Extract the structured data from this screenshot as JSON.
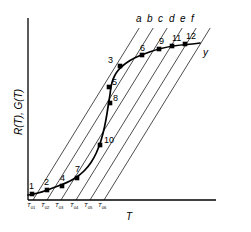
{
  "chart_data": {
    "type": "line",
    "title": "",
    "xlabel": "T",
    "ylabel": "R(T), G(T)",
    "grid": false,
    "legend": "none",
    "axis": {
      "x_origin_px": 28,
      "x_end_px": 216,
      "y_top_px": 18,
      "y_bottom_px": 200
    },
    "xtick_labels": [
      "T01",
      "T02",
      "T03",
      "T04",
      "T05",
      "T06"
    ],
    "xtick_bases": [
      "T",
      "T",
      "T",
      "T",
      "T",
      "T"
    ],
    "xtick_subs": [
      "01",
      "02",
      "03",
      "04",
      "05",
      "06"
    ],
    "xtick_px": [
      33,
      47,
      61,
      76,
      90,
      104
    ],
    "loadline_labels": [
      "a",
      "b",
      "c",
      "d",
      "e",
      "f"
    ],
    "loadline_label_px": [
      136,
      147,
      158,
      169,
      180,
      191
    ],
    "loadline_slope": -1.62,
    "loadlines": [
      {
        "name": "a",
        "x_bottom": 33,
        "x_top": 145
      },
      {
        "name": "b",
        "x_bottom": 47,
        "x_top": 159
      },
      {
        "name": "c",
        "x_bottom": 61,
        "x_top": 173
      },
      {
        "name": "d",
        "x_bottom": 76,
        "x_top": 188
      },
      {
        "name": "e",
        "x_bottom": 90,
        "x_top": 202
      },
      {
        "name": "f",
        "x_bottom": 104,
        "x_top": 216
      }
    ],
    "curve_name": "y",
    "curve_label_px": {
      "x": 203,
      "y": 48
    },
    "curve_points_px": [
      [
        28,
        195
      ],
      [
        34,
        194
      ],
      [
        42,
        192
      ],
      [
        50,
        189
      ],
      [
        58,
        186
      ],
      [
        66,
        183
      ],
      [
        74,
        179
      ],
      [
        81,
        174
      ],
      [
        88,
        167
      ],
      [
        94,
        158
      ],
      [
        99,
        147
      ],
      [
        103,
        134
      ],
      [
        106,
        120
      ],
      [
        108,
        107
      ],
      [
        110,
        95
      ],
      [
        111,
        86
      ],
      [
        113,
        79
      ],
      [
        116,
        73
      ],
      [
        120,
        68
      ],
      [
        126,
        63
      ],
      [
        134,
        58
      ],
      [
        144,
        54
      ],
      [
        155,
        50
      ],
      [
        167,
        47
      ],
      [
        180,
        45
      ],
      [
        193,
        44
      ],
      [
        200,
        43
      ]
    ],
    "markers": [
      {
        "label": "1",
        "x": 32,
        "y": 194,
        "label_dx": -3,
        "label_dy": -12
      },
      {
        "label": "2",
        "x": 47,
        "y": 190,
        "label_dx": -3,
        "label_dy": -12
      },
      {
        "label": "4",
        "x": 62,
        "y": 186,
        "label_dx": -2,
        "label_dy": -12
      },
      {
        "label": "7",
        "x": 77,
        "y": 178,
        "label_dx": -2,
        "label_dy": -13
      },
      {
        "label": "10",
        "x": 100,
        "y": 145,
        "label_dx": 4,
        "label_dy": -9
      },
      {
        "label": "8",
        "x": 110,
        "y": 103,
        "label_dx": 3,
        "label_dy": -9
      },
      {
        "label": "5",
        "x": 109,
        "y": 87,
        "label_dx": 3,
        "label_dy": -9
      },
      {
        "label": "3",
        "x": 120,
        "y": 66,
        "label_dx": -12,
        "label_dy": -10
      },
      {
        "label": "6",
        "x": 142,
        "y": 55,
        "label_dx": -2,
        "label_dy": -11
      },
      {
        "label": "9",
        "x": 159,
        "y": 49,
        "label_dx": 0,
        "label_dy": -12
      },
      {
        "label": "11",
        "x": 172,
        "y": 46,
        "label_dx": 0,
        "label_dy": -12
      },
      {
        "label": "12",
        "x": 185,
        "y": 44,
        "label_dx": 1,
        "label_dy": -12
      }
    ],
    "colors": {
      "axis": "#000000",
      "curve": "#000000",
      "loadline": "#000000",
      "marker": "#000000",
      "background": "#ffffff"
    }
  }
}
